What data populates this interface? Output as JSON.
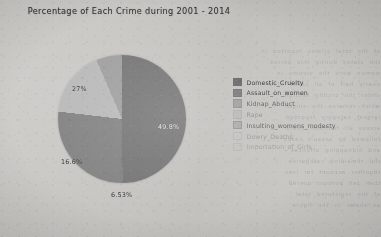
{
  "chart_data": {
    "type": "pie",
    "title": "Percentage of Each Crime during 2001 - 2014",
    "categories": [
      "Domestic_Cruelty",
      "Assault_on_women",
      "Kidnap_Abduct",
      "Rape",
      "Insulting_womens_modesty",
      "Dowry_Deaths",
      "Importation_of_Girls"
    ],
    "values": [
      49.8,
      27,
      16.6,
      6.53,
      0,
      0,
      0
    ],
    "visible_labels": [
      "49.8%",
      "27%",
      "16.6%",
      "6.53%"
    ],
    "slice_colors": [
      "#6e6e6e",
      "#7c7c7c",
      "#b5b5b5",
      "#9a9a9a",
      "#c4c4c4",
      "#cfcfcf",
      "#d8d8d8"
    ],
    "legend_position": "right",
    "grid": false,
    "xlabel": "",
    "ylabel": ""
  },
  "chart": {
    "title": "Percentage of Each Crime during 2001 - 2014",
    "slices": [
      {
        "label": "49.8%",
        "value": 49.8,
        "name": "Domestic_Cruelty",
        "color": "#6e6e6e",
        "label_style": "lbl-dark",
        "x": 100,
        "y": 68
      },
      {
        "label": "27%",
        "value": 27,
        "name": "Assault_on_women",
        "color": "#7c7c7c",
        "label_style": "lbl-light",
        "x": 14,
        "y": 30
      },
      {
        "label": "16.6%",
        "value": 16.6,
        "name": "Kidnap_Abduct",
        "color": "#b5b5b5",
        "label_style": "lbl-light",
        "x": 3,
        "y": 103
      },
      {
        "label": "6.53%",
        "value": 6.53,
        "name": "Rape",
        "color": "#9a9a9a",
        "label_style": "lbl-light",
        "x": 53,
        "y": 136
      }
    ]
  },
  "legend": {
    "items": [
      {
        "label": "Domestic_Cruelty",
        "color": "#5f5f5f"
      },
      {
        "label": "Assault_on_women",
        "color": "#6f6f6f"
      },
      {
        "label": "Kidnap_Abduct",
        "color": "#8e8e8e"
      },
      {
        "label": "Rape",
        "color": "#aaaaaa"
      },
      {
        "label": "Insulting_womens_modesty",
        "color": "#9c9c9c"
      },
      {
        "label": "Dowry_Deaths",
        "color": "#c2c2c2"
      },
      {
        "label": "Importation_of_Girls",
        "color": "#bcbcbc"
      }
    ]
  },
  "background_bleed": {
    "lines": [
      "of the total crimes reported in",
      "the states during this period",
      "women were the victims in",
      "nearly half of all cases filed",
      "under the cruelty section",
      "which remains the single",
      "largest category recorded",
      "across all fourteen years",
      "followed by assault cases",
      "and kidnapping offences",
      "the remaining categories",
      "together account for less",
      "than ten percent overall",
      "of the registered total",
      "as shown in the figure"
    ]
  }
}
